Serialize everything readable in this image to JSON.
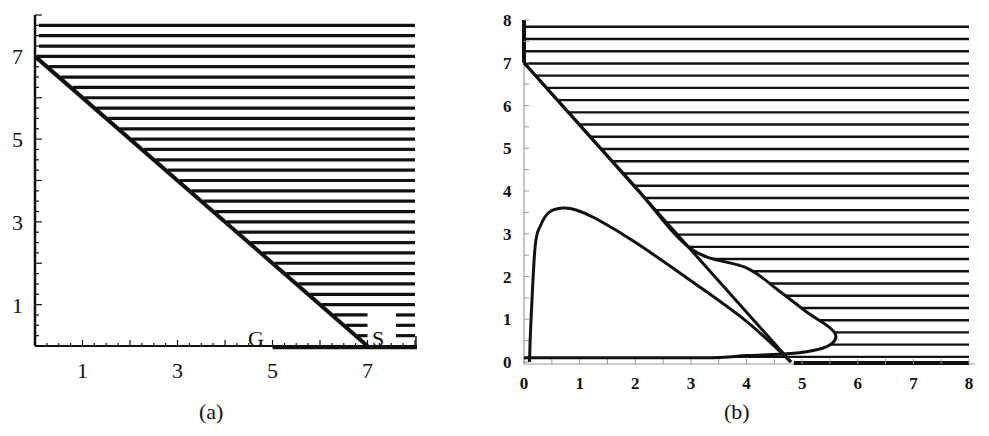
{
  "chart_data": [
    {
      "panel": "(a)",
      "type": "area",
      "title": "",
      "xlabel": "",
      "ylabel": "",
      "xlim": [
        0,
        8
      ],
      "ylim": [
        0,
        8
      ],
      "xticks": [
        1,
        3,
        5,
        7
      ],
      "yticks": [
        1,
        3,
        5,
        7
      ],
      "grid": false,
      "legend": null,
      "boundary_line": {
        "x": [
          0,
          7
        ],
        "y": [
          7,
          0
        ]
      },
      "hatched_region": "above line x + y = 7 (horizontal hatching)",
      "hatch_spacing": 0.25,
      "annotations": [
        {
          "text": "G",
          "x": 4.8,
          "y": 0.1
        },
        {
          "text": "S",
          "x": 7.3,
          "y": 0.1
        }
      ]
    },
    {
      "panel": "(b)",
      "type": "area",
      "title": "",
      "xlabel": "",
      "ylabel": "",
      "xlim": [
        0,
        8
      ],
      "ylim": [
        0,
        8
      ],
      "xticks": [
        0,
        1,
        2,
        3,
        4,
        5,
        6,
        7,
        8
      ],
      "yticks": [
        0,
        1,
        2,
        3,
        4,
        5,
        6,
        7,
        8
      ],
      "grid": false,
      "legend": null,
      "boundary_line": {
        "x": [
          0,
          4.8
        ],
        "y": [
          7,
          0
        ]
      },
      "hatched_boundary": {
        "x": [
          0,
          1,
          2,
          3,
          4,
          4.6,
          5.1,
          5.45,
          5.6,
          5.55,
          5.3,
          4.8,
          4.0,
          3.4,
          2.0,
          0.0
        ],
        "y": [
          7,
          5.55,
          4.1,
          2.65,
          2.2,
          1.65,
          1.15,
          0.85,
          0.65,
          0.45,
          0.3,
          0.2,
          0.15,
          0.1,
          0.1,
          0.1
        ]
      },
      "inner_curve": {
        "x": [
          0.1,
          0.12,
          0.2,
          0.3,
          0.45,
          0.7,
          0.95,
          1.3,
          2.0,
          3.0,
          4.0,
          4.8
        ],
        "y": [
          0.0,
          0.8,
          2.7,
          3.2,
          3.5,
          3.6,
          3.55,
          3.35,
          2.8,
          1.9,
          0.95,
          0.0
        ]
      },
      "hatched_region": "outside the closed curve and above line (horizontal hatching)",
      "hatch_spacing": 0.286
    }
  ],
  "panels": {
    "a": {
      "label": "(a)",
      "xtick_labels": [
        "1",
        "3",
        "5",
        "7"
      ],
      "ytick_labels": [
        "1",
        "3",
        "5",
        "7"
      ],
      "annotation_g": "G",
      "annotation_s": "S"
    },
    "b": {
      "label": "(b)",
      "xtick_labels": [
        "0",
        "1",
        "2",
        "3",
        "4",
        "5",
        "6",
        "7",
        "8"
      ],
      "ytick_labels": [
        "0",
        "1",
        "2",
        "3",
        "4",
        "5",
        "6",
        "7",
        "8"
      ]
    }
  },
  "colors": {
    "ink": "#111111",
    "axis_b": "#999999",
    "background": "#ffffff"
  }
}
